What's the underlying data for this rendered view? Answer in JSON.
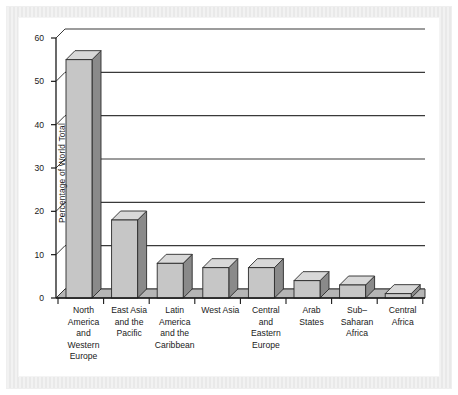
{
  "chart_data": {
    "type": "bar",
    "title": "",
    "subtitle": "",
    "xlabel": "",
    "ylabel": "Percentage of World Total",
    "ylim": [
      0,
      60
    ],
    "ytick_values": [
      0,
      10,
      20,
      30,
      40,
      50,
      60
    ],
    "ytick_labels": [
      "0",
      "10",
      "20",
      "30",
      "40",
      "50",
      "60"
    ],
    "grid": "horizontal",
    "legend": "none",
    "style": "3d-bar",
    "categories": [
      "North America and Western Europe",
      "East Asia and the Pacific",
      "Latin America and the Caribbean",
      "West Asia",
      "Central and Eastern Europe",
      "Arab States",
      "Sub-Saharan Africa",
      "Central Africa"
    ],
    "category_lines": [
      [
        "North",
        "America",
        "and",
        "Western",
        "Europe"
      ],
      [
        "East Asia",
        "and the",
        "Pacific"
      ],
      [
        "Latin",
        "America",
        "and the",
        "Caribbean"
      ],
      [
        "West Asia"
      ],
      [
        "Central",
        "and",
        "Eastern",
        "Europe"
      ],
      [
        "Arab",
        "States"
      ],
      [
        "Sub–",
        "Saharan",
        "Africa"
      ],
      [
        "Central",
        "Africa"
      ]
    ],
    "values": [
      55,
      18,
      8,
      7,
      7,
      4,
      3,
      1
    ]
  },
  "colors": {
    "bar_front": "#c6c6c6",
    "bar_side": "#8a8a8a",
    "bar_top": "#d8d8d8",
    "bar_outline": "#2b2b2b",
    "axis": "#1a1a1a",
    "gridline": "#3a3a3a",
    "floor": "#b5b5b5",
    "background": "#ffffff",
    "frame": "#eeeeee"
  }
}
